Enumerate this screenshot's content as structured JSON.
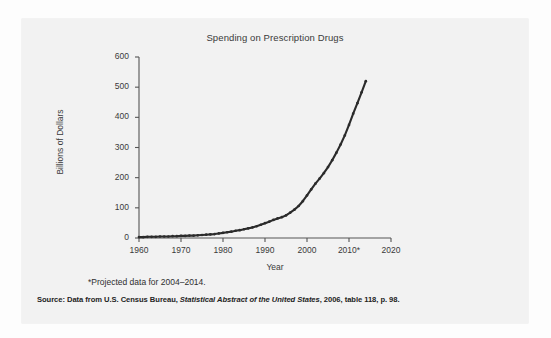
{
  "figure": {
    "footnote": "*Projected data for 2004–2014.",
    "source_prefix": "Source: Data from U.S. Census Bureau, ",
    "source_italic": "Statistical Abstract of the United States",
    "source_suffix": ", 2006, table 118, p. 98.",
    "line_color": "#2b2b2b",
    "text_color": "#3a3a3a",
    "card_color": "#f2f2f2",
    "page_color": "#fdfdfd"
  },
  "chart_data": {
    "type": "line",
    "title": "Spending on Prescription Drugs",
    "xlabel": "Year",
    "ylabel": "Billions of Dollars",
    "xlim": [
      1960,
      2020
    ],
    "ylim": [
      0,
      600
    ],
    "xticks": [
      1960,
      1970,
      1980,
      1990,
      2000,
      2010,
      2020
    ],
    "xtick_labels": [
      "1960",
      "1970",
      "1980",
      "1990",
      "2000",
      "2010*",
      "2020"
    ],
    "yticks": [
      0,
      100,
      200,
      300,
      400,
      500,
      600
    ],
    "ytick_labels": [
      "0",
      "100",
      "200",
      "300",
      "400",
      "500",
      "600"
    ],
    "grid": false,
    "legend": "none",
    "markers": "small dots at each annual data point",
    "annotations": [
      "*Projected data for 2004–2014."
    ],
    "x": [
      1960,
      1961,
      1962,
      1963,
      1964,
      1965,
      1966,
      1967,
      1968,
      1969,
      1970,
      1971,
      1972,
      1973,
      1974,
      1975,
      1976,
      1977,
      1978,
      1979,
      1980,
      1981,
      1982,
      1983,
      1984,
      1985,
      1986,
      1987,
      1988,
      1989,
      1990,
      1991,
      1992,
      1993,
      1994,
      1995,
      1996,
      1997,
      1998,
      1999,
      2000,
      2001,
      2002,
      2003,
      2004,
      2005,
      2006,
      2007,
      2008,
      2009,
      2010,
      2011,
      2012,
      2013,
      2014
    ],
    "values": [
      3,
      3,
      4,
      4,
      4,
      5,
      5,
      5,
      6,
      6,
      7,
      7,
      8,
      8,
      9,
      10,
      11,
      12,
      13,
      15,
      17,
      19,
      21,
      24,
      26,
      29,
      32,
      35,
      39,
      44,
      49,
      54,
      60,
      65,
      69,
      75,
      84,
      94,
      106,
      122,
      141,
      161,
      180,
      197,
      215,
      235,
      258,
      283,
      310,
      340,
      375,
      412,
      447,
      483,
      520
    ],
    "series_name": "Spending on prescription drugs (billions of dollars)"
  }
}
